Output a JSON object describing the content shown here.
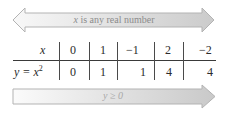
{
  "top_arrow": {
    "type": "double-headed",
    "label_var": "x",
    "label_rest": " is any real number",
    "fill_start": "#f7f7f7",
    "fill_end": "#cfcfcf",
    "stroke": "#b5b5b5"
  },
  "table": {
    "row_headers": {
      "x": "x",
      "y_prefix": "y = x",
      "y_exp": "2"
    },
    "x_values": [
      "0",
      "1",
      "−1",
      "2",
      "−2"
    ],
    "y_values": [
      "0",
      "1",
      "1",
      "4",
      "4"
    ]
  },
  "bottom_arrow": {
    "type": "single-headed-right",
    "label": "y ≥ 0",
    "fill_start": "#fafafa",
    "fill_end": "#cdcdcd",
    "stroke": "#b5b5b5"
  }
}
